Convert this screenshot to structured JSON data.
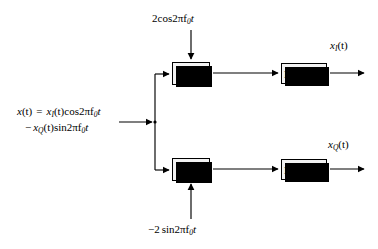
{
  "diagram": {
    "input": {
      "line1": {
        "signal": "x",
        "arg": "(t)",
        "equals": "=",
        "term_signal": "x",
        "term_sub": "I",
        "term_arg": "(t)",
        "trig": "cos",
        "carrier": "2πf",
        "carrier_sub": "0",
        "carrier_t": "t"
      },
      "line2": {
        "sign": "−",
        "term_signal": "x",
        "term_sub": "Q",
        "term_arg": "(t)",
        "trig": "sin",
        "carrier": "2πf",
        "carrier_sub": "0",
        "carrier_t": "t"
      },
      "plain_text": "x(t) = x_I(t)cos2πf_0t − x_Q(t)sin2πf_0t"
    },
    "carriers": [
      {
        "id": "carrier-top",
        "amplitude": "2",
        "trig": "cos",
        "frequency": "2πf",
        "sub": "0",
        "time": "t",
        "plain_text": "2cos2πf_0t",
        "direction": "down-into-top-mixer"
      },
      {
        "id": "carrier-bottom",
        "amplitude": "−2",
        "trig": "sin",
        "frequency": "2πf",
        "sub": "0",
        "time": "t",
        "plain_text": "−2sin2πf_0t",
        "direction": "up-into-bottom-mixer"
      }
    ],
    "blocks": [
      {
        "id": "mixer-top",
        "label": "mixer",
        "branch": "I"
      },
      {
        "id": "mixer-bottom",
        "label": "mixer",
        "branch": "Q"
      },
      {
        "id": "lpf-top",
        "label": "LP Filter",
        "branch": "I"
      },
      {
        "id": "lpf-bottom",
        "label": "LP Filter",
        "branch": "Q"
      }
    ],
    "outputs": [
      {
        "id": "output-i",
        "signal": "x",
        "sub": "I",
        "arg": "(t)",
        "plain_text": "x_I(t)"
      },
      {
        "id": "output-q",
        "signal": "x",
        "sub": "Q",
        "arg": "(t)",
        "plain_text": "x_Q(t)"
      }
    ],
    "colors": {
      "stroke": "#000000",
      "block_fill": "#f2f2f2",
      "shadow": "#000000",
      "background": "#ffffff"
    }
  }
}
